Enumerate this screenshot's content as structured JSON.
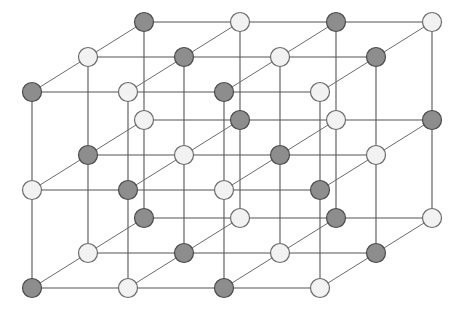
{
  "figure": {
    "name": "rock-salt-crystal-lattice",
    "background_color": "#ffffff"
  },
  "projection": {
    "origin_x": 32,
    "origin_y": 92,
    "step_x": 96,
    "step_y": 98,
    "depth_dx": 56,
    "depth_dy": -35,
    "columns": 4,
    "rows": 3,
    "layers": 3
  },
  "atoms": {
    "radius": 9.5,
    "types": [
      {
        "id": "dark",
        "label": "dark-atom",
        "fill": "#8d8d8d",
        "stroke": "#4a4a4a"
      },
      {
        "id": "light",
        "label": "light-atom",
        "fill": "#f2f2f2",
        "stroke": "#6a6a6a"
      }
    ],
    "arrangement": "alternating-checkerboard",
    "parity_rule": "(column + row + layer) even = dark, odd = light",
    "total_count": 36
  },
  "bonds": {
    "color": "#555555",
    "width": 1.1,
    "depth_color": "#6b6b6b",
    "depth_width": 1.0,
    "directions": [
      "horizontal",
      "vertical",
      "depth-diagonal"
    ]
  },
  "chart_data": {
    "type": "scatter",
    "title": "",
    "xlabel": "",
    "ylabel": "",
    "grid": true,
    "legend": [],
    "series": [
      {
        "name": "dark-atom",
        "color": "#8d8d8d",
        "points": [
          [
            32,
            92
          ],
          [
            222,
            92
          ],
          [
            32,
            288
          ],
          [
            222,
            288
          ],
          [
            125,
            190
          ],
          [
            318,
            190
          ],
          [
            144,
            22
          ],
          [
            334,
            22
          ],
          [
            144,
            218
          ],
          [
            334,
            218
          ],
          [
            237,
            120
          ],
          [
            88,
            155
          ],
          [
            278,
            155
          ],
          [
            88,
            57
          ],
          [
            278,
            57
          ],
          [
            181,
            253
          ],
          [
            371,
            253
          ],
          [
            430,
            124
          ],
          [
            430,
            26
          ]
        ]
      },
      {
        "name": "light-atom",
        "color": "#f2f2f2",
        "points": [
          [
            125,
            92
          ],
          [
            318,
            92
          ],
          [
            125,
            288
          ],
          [
            318,
            288
          ],
          [
            32,
            190
          ],
          [
            222,
            190
          ],
          [
            414,
            190
          ],
          [
            237,
            22
          ],
          [
            430,
            22
          ],
          [
            237,
            218
          ],
          [
            430,
            218
          ],
          [
            144,
            120
          ],
          [
            334,
            120
          ],
          [
            181,
            155
          ],
          [
            371,
            155
          ],
          [
            181,
            57
          ],
          [
            371,
            57
          ],
          [
            88,
            253
          ],
          [
            278,
            253
          ]
        ]
      }
    ]
  }
}
